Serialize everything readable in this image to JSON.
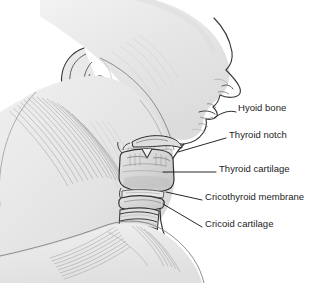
{
  "figure": {
    "view": "left lateral profile, facing right",
    "background_color": "#ffffff",
    "ink_color": "#1c1c1c",
    "skin_shade": "#ededed",
    "cartilage_shade": "#d8d8d8",
    "text_color": "#1c1c1c"
  },
  "labels": [
    {
      "id": "hyoid-bone",
      "text": "Hyoid bone",
      "x": 238,
      "y": 107,
      "leader": {
        "x1": 236,
        "y1": 113,
        "x2": 213,
        "y2": 118,
        "curved": true
      }
    },
    {
      "id": "thyroid-notch",
      "text": "Thyroid notch",
      "x": 229,
      "y": 134,
      "leader": {
        "x1": 226,
        "y1": 139,
        "x2": 177,
        "y2": 152,
        "curved": false
      }
    },
    {
      "id": "thyroid-cartilage",
      "text": "Thyroid cartilage",
      "x": 219,
      "y": 168,
      "leader": {
        "x1": 216,
        "y1": 173,
        "x2": 163,
        "y2": 173,
        "curved": false
      }
    },
    {
      "id": "cricothyroid-membrane",
      "text": "Cricothyroid membrane",
      "x": 205,
      "y": 196,
      "leader": {
        "x1": 202,
        "y1": 201,
        "x2": 165,
        "y2": 191,
        "curved": false
      }
    },
    {
      "id": "cricoid-cartilage",
      "text": "Cricoid cartilage",
      "x": 205,
      "y": 223,
      "leader": {
        "x1": 202,
        "y1": 228,
        "x2": 162,
        "y2": 203,
        "curved": false
      }
    }
  ],
  "structures": {
    "head": "profile of head facing right with nose, lips, chin",
    "ear": "auricle with helix, antihelix, concha, lobule",
    "neck": "sternocleidomastoid and platysma hatching",
    "larynx": "thyroid cartilage with superior notch",
    "trachea": "stacked tracheal cartilage rings",
    "shoulder": "trapezius and clavicle region with hatch shading",
    "tracheal_ring_count": 8
  }
}
